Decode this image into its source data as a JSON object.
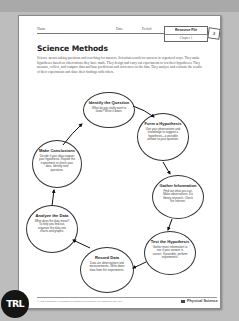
{
  "header": {
    "name_label": "Name",
    "date_label": "Date",
    "period_label": "Period",
    "resource_title": "Resource File",
    "chapter": "Chapter 1",
    "tab_number": "3"
  },
  "title": "Science Methods",
  "intro": "Science means asking questions and searching for answers. Scientists search for answers in organized ways. They make hypotheses based on observations they have made. They design and carry out experiments to test their hypotheses. They measure, collect, and compare data and base predictions and inferences on the data. They analyze and evaluate the results of their experiments and share their findings with others.",
  "cycle": [
    {
      "title": "Identify the Question",
      "body": "What do you really want to know? Write it down."
    },
    {
      "title": "Form a Hypothesis",
      "body": "Use your observations and knowledge to suggest a hypothesis—a possible answer to your question."
    },
    {
      "title": "Gather Information",
      "body": "Find out what you can. Make observations. Do library research. Check the Internet."
    },
    {
      "title": "Test the Hypothesis",
      "body": "Gather more information to see if your answer is correct. If possible, perform experiments."
    },
    {
      "title": "Record Data",
      "body": "Data are observations and measurements. Write down data from the experiments."
    },
    {
      "title": "Analyze the Data",
      "body": "What does the data mean? To help you find out, organize the data into charts and graphs."
    },
    {
      "title": "Make Conclusions",
      "body": "Decide if your data support your hypothesis. Repeat the experiment to check your data. Identify new questions."
    }
  ],
  "footer": {
    "copyright": "©AGS Publishing. Permission is granted to reproduce for classroom use only.",
    "book": "Physical Science"
  },
  "logo": "TRL"
}
